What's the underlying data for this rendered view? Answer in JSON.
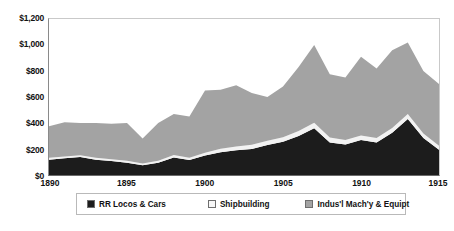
{
  "chart_data": {
    "type": "area",
    "stacked": true,
    "title": "",
    "xlabel": "",
    "ylabel": "",
    "grid": false,
    "legend_position": "bottom",
    "x": [
      1890,
      1891,
      1892,
      1893,
      1894,
      1895,
      1896,
      1897,
      1898,
      1899,
      1900,
      1901,
      1902,
      1903,
      1904,
      1905,
      1906,
      1907,
      1908,
      1909,
      1910,
      1911,
      1912,
      1913,
      1914,
      1915
    ],
    "xlim": [
      1890,
      1915
    ],
    "ylim": [
      0,
      1200
    ],
    "yticks": [
      0,
      200,
      400,
      600,
      800,
      1000,
      1200
    ],
    "ytick_labels": [
      "$0",
      "$200",
      "$400",
      "$600",
      "$800",
      "$1,000",
      "$1,200"
    ],
    "xticks": [
      1890,
      1895,
      1900,
      1905,
      1910,
      1915
    ],
    "xtick_labels": [
      "1890",
      "1895",
      "1900",
      "1905",
      "1910",
      "1915"
    ],
    "series": [
      {
        "name": "RR Locos & Cars",
        "color": "#1c1c1c",
        "values": [
          118,
          128,
          138,
          118,
          108,
          95,
          75,
          95,
          135,
          115,
          150,
          175,
          190,
          200,
          230,
          255,
          300,
          360,
          250,
          235,
          270,
          250,
          325,
          430,
          285,
          195
        ]
      },
      {
        "name": "Shipbuilding",
        "color": "#f2f2f2",
        "values": [
          14,
          14,
          14,
          14,
          14,
          14,
          14,
          14,
          18,
          18,
          22,
          26,
          30,
          32,
          34,
          36,
          38,
          42,
          38,
          34,
          34,
          34,
          36,
          40,
          34,
          30
        ]
      },
      {
        "name": "Indus'l Mach'y & Equipt",
        "color": "#a3a3a3",
        "values": [
          243,
          263,
          248,
          268,
          273,
          291,
          191,
          291,
          317,
          317,
          478,
          454,
          470,
          398,
          336,
          389,
          492,
          598,
          487,
          481,
          606,
          536,
          599,
          550,
          481,
          475
        ]
      }
    ],
    "totals": [
      375,
      405,
      400,
      400,
      395,
      400,
      280,
      400,
      470,
      450,
      650,
      655,
      690,
      630,
      600,
      680,
      830,
      1000,
      775,
      750,
      910,
      820,
      960,
      1020,
      800,
      700
    ]
  },
  "legend": {
    "items": [
      {
        "label": "RR Locos & Cars",
        "swatch": "#1c1c1c"
      },
      {
        "label": "Shipbuilding",
        "swatch": "#f7f7f7"
      },
      {
        "label": "Indus'l Mach'y & Equipt",
        "swatch": "#a3a3a3"
      }
    ]
  }
}
